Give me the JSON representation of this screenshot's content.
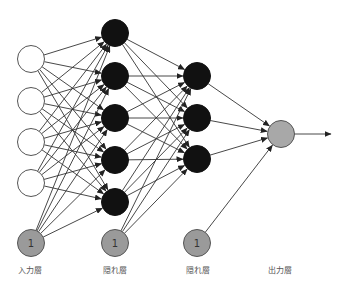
{
  "diagram": {
    "type": "feedforward-neural-network",
    "colors": {
      "input_fill": "#ffffff",
      "input_stroke": "#555555",
      "hidden_fill": "#111111",
      "bias_fill": "#9a9a9a",
      "bias_stroke": "#555555",
      "output_fill": "#a8a8a8",
      "edge": "#333333"
    },
    "layers": [
      {
        "name": "input",
        "label": "入力層",
        "x": 31,
        "nodes_y": [
          59,
          101,
          142,
          183
        ],
        "kind": "input",
        "bias": {
          "y": 243,
          "text": "1"
        }
      },
      {
        "name": "hidden1",
        "label": "隠れ層",
        "x": 115,
        "nodes_y": [
          33,
          76,
          118,
          160,
          202
        ],
        "kind": "hidden",
        "bias": {
          "y": 243,
          "text": "1"
        }
      },
      {
        "name": "hidden2",
        "label": "隠れ層",
        "x": 197,
        "nodes_y": [
          76,
          118,
          159
        ],
        "kind": "hidden",
        "bias": {
          "y": 243,
          "text": "1"
        }
      },
      {
        "name": "output",
        "label": "出力層",
        "x": 281,
        "nodes_y": [
          134
        ],
        "kind": "output"
      }
    ],
    "output_arrow_end_x": 331,
    "labels": {
      "input": "入力層",
      "hidden1": "隠れ層",
      "hidden2": "隠れ層",
      "output": "出力層"
    }
  }
}
